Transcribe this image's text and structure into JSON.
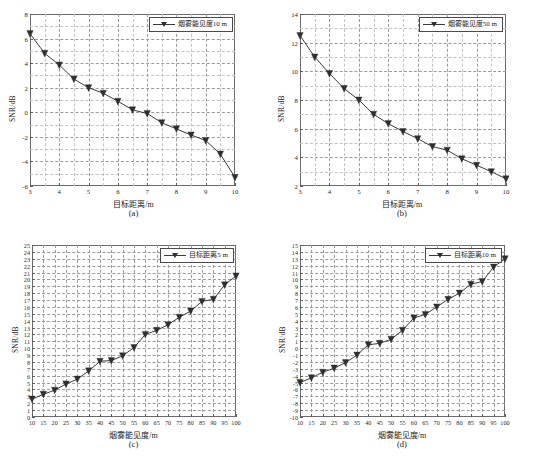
{
  "figure": {
    "panels": [
      {
        "key": "a",
        "caption": "(a)",
        "legend_label": "烟雾能见度10 m",
        "xlabel": "目标距离/m",
        "ylabel": "SNR/dB"
      },
      {
        "key": "b",
        "caption": "(b)",
        "legend_label": "烟雾能见度50 m",
        "xlabel": "目标距离/m",
        "ylabel": "SNR/dB"
      },
      {
        "key": "c",
        "caption": "(c)",
        "legend_label": "目标距离5 m",
        "xlabel": "烟雾能见度/m",
        "ylabel": "SNR/dB"
      },
      {
        "key": "d",
        "caption": "(d)",
        "legend_label": "目标距离10 m",
        "xlabel": "烟雾能见度/m",
        "ylabel": "SNR/dB"
      }
    ],
    "line_color": "#3a3a3a",
    "marker_color": "#2f2f2f",
    "grid_color": "#9a9a9a"
  },
  "chart_data": [
    {
      "type": "line",
      "panel": "a",
      "title": "(a)",
      "xlabel": "目标距离/m",
      "ylabel": "SNR/dB",
      "legend": [
        "烟雾能见度10 m"
      ],
      "legend_position": "top-right",
      "grid": true,
      "xlim": [
        3,
        10
      ],
      "ylim": [
        -6,
        8
      ],
      "xticks": [
        3,
        4,
        5,
        6,
        7,
        8,
        9,
        10
      ],
      "yticks": [
        -6,
        -4,
        -2,
        0,
        2,
        4,
        6,
        8
      ],
      "x": [
        3,
        3.5,
        4,
        4.5,
        5,
        5.5,
        6,
        6.5,
        7,
        7.5,
        8,
        8.5,
        9,
        9.5,
        10
      ],
      "values": [
        6.4,
        4.8,
        3.85,
        2.7,
        2.0,
        1.55,
        0.9,
        0.2,
        -0.1,
        -0.85,
        -1.35,
        -1.85,
        -2.3,
        -3.4,
        -5.3
      ],
      "marker": "triangle-down"
    },
    {
      "type": "line",
      "panel": "b",
      "title": "(b)",
      "xlabel": "目标距离/m",
      "ylabel": "SNR/dB",
      "legend": [
        "烟雾能见度50 m"
      ],
      "legend_position": "top-right",
      "grid": true,
      "xlim": [
        3,
        10
      ],
      "ylim": [
        2,
        14
      ],
      "xticks": [
        3,
        4,
        5,
        6,
        7,
        8,
        9,
        10
      ],
      "yticks": [
        2,
        4,
        6,
        8,
        10,
        12,
        14
      ],
      "x": [
        3,
        3.5,
        4,
        4.5,
        5,
        5.5,
        6,
        6.5,
        7,
        7.5,
        8,
        8.5,
        9,
        9.5,
        10
      ],
      "values": [
        12.5,
        11.0,
        9.85,
        8.8,
        8.0,
        7.0,
        6.35,
        5.8,
        5.3,
        4.75,
        4.5,
        3.9,
        3.45,
        3.0,
        2.5
      ],
      "marker": "triangle-down"
    },
    {
      "type": "line",
      "panel": "c",
      "title": "(c)",
      "xlabel": "烟雾能见度/m",
      "ylabel": "SNR/dB",
      "legend": [
        "目标距离5 m"
      ],
      "legend_position": "top-right",
      "grid": true,
      "xlim": [
        10,
        100
      ],
      "ylim": [
        0,
        25
      ],
      "xticks": [
        10,
        15,
        20,
        25,
        30,
        35,
        40,
        45,
        50,
        55,
        60,
        65,
        70,
        75,
        80,
        85,
        90,
        95,
        100
      ],
      "yticks": [
        0,
        1,
        2,
        3,
        4,
        5,
        6,
        7,
        8,
        9,
        10,
        11,
        12,
        13,
        14,
        15,
        16,
        17,
        18,
        19,
        20,
        21,
        22,
        23,
        24,
        25
      ],
      "x": [
        10,
        15,
        20,
        25,
        30,
        35,
        40,
        45,
        50,
        55,
        60,
        65,
        70,
        75,
        80,
        85,
        90,
        95,
        100
      ],
      "values": [
        2.6,
        3.3,
        3.9,
        4.8,
        5.5,
        6.7,
        8.1,
        8.2,
        8.9,
        10.1,
        12.0,
        12.6,
        13.4,
        14.5,
        15.4,
        16.8,
        17.1,
        19.2,
        20.5
      ],
      "marker": "triangle-down"
    },
    {
      "type": "line",
      "panel": "d",
      "title": "(d)",
      "xlabel": "烟雾能见度/m",
      "ylabel": "SNR/dB",
      "legend": [
        "目标距离10 m"
      ],
      "legend_position": "top-right",
      "grid": true,
      "xlim": [
        10,
        100
      ],
      "ylim": [
        -10,
        15
      ],
      "xticks": [
        10,
        15,
        20,
        25,
        30,
        35,
        40,
        45,
        50,
        55,
        60,
        65,
        70,
        75,
        80,
        85,
        90,
        95,
        100
      ],
      "yticks": [
        -10,
        -9,
        -8,
        -7,
        -6,
        -5,
        -4,
        -3,
        -2,
        -1,
        0,
        1,
        2,
        3,
        4,
        5,
        6,
        7,
        8,
        9,
        10,
        11,
        12,
        13,
        14,
        15
      ],
      "x": [
        10,
        15,
        20,
        25,
        30,
        35,
        40,
        45,
        50,
        55,
        60,
        65,
        70,
        75,
        80,
        85,
        90,
        95,
        100
      ],
      "values": [
        -5.0,
        -4.3,
        -3.5,
        -2.9,
        -2.1,
        -1.0,
        0.5,
        0.7,
        1.3,
        2.6,
        4.4,
        4.9,
        6.0,
        7.1,
        8.0,
        9.3,
        9.7,
        11.8,
        13.0
      ],
      "marker": "triangle-down"
    }
  ]
}
